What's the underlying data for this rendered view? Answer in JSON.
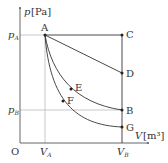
{
  "diagram": {
    "axes": {
      "y_label": "p",
      "y_unit": "[Pa]",
      "x_label": "V",
      "x_unit": "[m³]",
      "origin": "O"
    },
    "ticks": {
      "pA": {
        "main": "p",
        "sub": "A"
      },
      "pB": {
        "main": "p",
        "sub": "B"
      },
      "VA": {
        "main": "V",
        "sub": "A"
      },
      "VB": {
        "main": "V",
        "sub": "B"
      }
    },
    "points": {
      "A": "A",
      "B": "B",
      "C": "C",
      "D": "D",
      "E": "E",
      "F": "F",
      "G": "G"
    },
    "colors": {
      "line": "#333333",
      "guide": "#bbbbbb"
    }
  }
}
